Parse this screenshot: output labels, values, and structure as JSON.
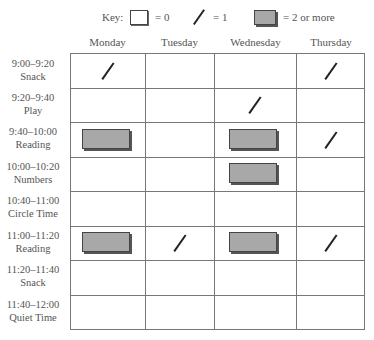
{
  "key": {
    "title": "Key:",
    "items": [
      {
        "symbol": "empty-box",
        "label": "= 0"
      },
      {
        "symbol": "slash",
        "label": "= 1"
      },
      {
        "symbol": "filled-box",
        "label": "= 2 or more"
      }
    ]
  },
  "days": [
    "Monday",
    "Tuesday",
    "Wednesday",
    "Thursday"
  ],
  "rows": [
    {
      "time": "9:00–9:20",
      "activity": "Snack",
      "marks": [
        "slash",
        "",
        "",
        "slash"
      ]
    },
    {
      "time": "9:20–9:40",
      "activity": "Play",
      "marks": [
        "",
        "",
        "slash",
        ""
      ]
    },
    {
      "time": "9:40–10:00",
      "activity": "Reading",
      "marks": [
        "filled",
        "",
        "filled",
        "slash"
      ]
    },
    {
      "time": "10:00–10:20",
      "activity": "Numbers",
      "marks": [
        "",
        "",
        "filled",
        ""
      ]
    },
    {
      "time": "10:40–11:00",
      "activity": "Circle Time",
      "marks": [
        "",
        "",
        "",
        ""
      ]
    },
    {
      "time": "11:00–11:20",
      "activity": "Reading",
      "marks": [
        "filled",
        "slash",
        "filled",
        "slash"
      ]
    },
    {
      "time": "11:20–11:40",
      "activity": "Snack",
      "marks": [
        "",
        "",
        "",
        ""
      ]
    },
    {
      "time": "11:40–12:00",
      "activity": "Quiet Time",
      "marks": [
        "",
        "",
        "",
        ""
      ]
    }
  ]
}
